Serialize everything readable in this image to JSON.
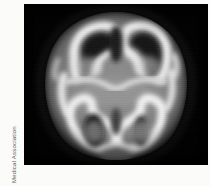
{
  "figure": {
    "kind": "medical-brain-scan",
    "modality": "PET axial brain slice",
    "background_color": "#fbfbfa",
    "panel_color": "#020202"
  },
  "credit": {
    "text": "© 1987 American Medical Association",
    "symbol": "©",
    "year": "1987",
    "organization": "American Medical Association",
    "color": "#5d5d5d",
    "orientation": "rotated-90-ccw",
    "position": "left-margin"
  },
  "scan": {
    "orientation": "axial",
    "anterior": "top",
    "posterior": "bottom",
    "colormap": "grayscale",
    "intensity_levels": {
      "background": "#020202",
      "low": "#3a3a3a",
      "mid_gray": "#8d8d8d",
      "high": "#c9c9c9",
      "peak": "#f2f2f2"
    },
    "regions": [
      {
        "name": "frontal-cortex-left",
        "intensity": "high"
      },
      {
        "name": "frontal-cortex-right",
        "intensity": "high"
      },
      {
        "name": "interhemispheric-fissure",
        "intensity": "low"
      },
      {
        "name": "basal-ganglia",
        "intensity": "mid"
      },
      {
        "name": "temporal-cortex-left",
        "intensity": "high"
      },
      {
        "name": "temporal-cortex-right",
        "intensity": "high"
      },
      {
        "name": "ventricle-left",
        "intensity": "low"
      },
      {
        "name": "ventricle-right",
        "intensity": "low"
      },
      {
        "name": "occipital-cortex",
        "intensity": "peak"
      }
    ]
  }
}
